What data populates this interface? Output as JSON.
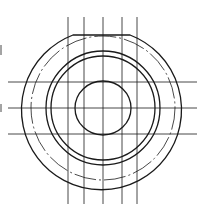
{
  "diagram": {
    "type": "technical-drawing",
    "center": [
      103,
      108
    ],
    "outer_profile": {
      "radius": 80,
      "flat_top_y": 35,
      "flat_x": [
        73,
        130
      ]
    },
    "dashdot_circle_radius": 72,
    "solid_rings": [
      57,
      52
    ],
    "inner_bore": {
      "rx": 28,
      "ry": 27
    },
    "vertical_lines_x": [
      68,
      84,
      103,
      122,
      137
    ],
    "horizontal_lines_y": [
      82,
      108,
      134
    ],
    "colors": {
      "line": "#1a1a1a",
      "background": "#ffffff"
    }
  }
}
